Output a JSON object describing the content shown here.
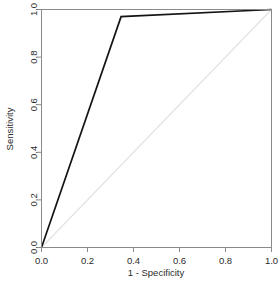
{
  "figure": {
    "name": "roc-curve-plot",
    "background_color": "#ffffff"
  },
  "chart_data": {
    "type": "line",
    "title": "",
    "xlabel": "1 - Specificity",
    "ylabel": "Sensitivity",
    "xlim": [
      0,
      1
    ],
    "ylim": [
      0,
      1
    ],
    "grid": false,
    "legend": null,
    "xticks": [
      "0.0",
      "0.2",
      "0.4",
      "0.6",
      "0.8",
      "1.0"
    ],
    "xtick_values": [
      0,
      0.2,
      0.4,
      0.6,
      0.8,
      1
    ],
    "yticks": [
      "0.0",
      "0.2",
      "0.4",
      "0.6",
      "0.8",
      "1.0"
    ],
    "ytick_values": [
      0,
      0.2,
      0.4,
      0.6,
      0.8,
      1
    ],
    "series": [
      {
        "name": "ROC curve",
        "color": "#141414",
        "width": 1.7,
        "x": [
          0,
          0.346,
          1
        ],
        "y": [
          0,
          0.97,
          1
        ]
      },
      {
        "name": "Chance diagonal",
        "color": "#e2e2e2",
        "width": 1.1,
        "x": [
          0,
          1
        ],
        "y": [
          0,
          1
        ]
      }
    ]
  },
  "axes": {
    "x_axis_title": "1 - Specificity",
    "y_axis_title": "Sensitivity",
    "box_color": "#8a8a8a"
  }
}
